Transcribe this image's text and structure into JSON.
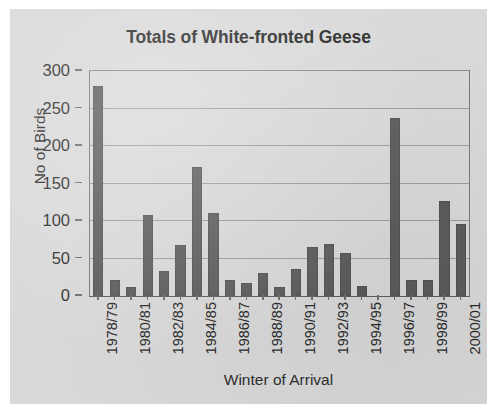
{
  "chart_data": {
    "type": "bar",
    "title": "Totals of White-fronted Geese",
    "xlabel": "Winter of Arrival",
    "ylabel": "No of Birds",
    "ylim": [
      0,
      300
    ],
    "yticks": [
      0,
      50,
      100,
      150,
      200,
      250,
      300
    ],
    "ytick_labels": [
      "0",
      "50",
      "100",
      "150",
      "200",
      "250",
      "300"
    ],
    "grid": "horizontal",
    "legend": "none",
    "bar_color": "#5c5c5c",
    "plot_background": "#d9d9d9",
    "categories": [
      "1978/79",
      "1979/80",
      "1980/81",
      "1981/82",
      "1982/83",
      "1983/84",
      "1984/85",
      "1985/86",
      "1986/87",
      "1987/88",
      "1988/89",
      "1989/90",
      "1990/91",
      "1991/92",
      "1992/93",
      "1993/94",
      "1994/95",
      "1995/96",
      "1996/97",
      "1997/98",
      "1998/99",
      "1999/00",
      "2000/01"
    ],
    "tick_labels_shown": [
      "1978/79",
      "",
      "1980/81",
      "",
      "1982/83",
      "",
      "1984/85",
      "",
      "1986/87",
      "",
      "1988/89",
      "",
      "1990/91",
      "",
      "1992/93",
      "",
      "1994/95",
      "",
      "1996/97",
      "",
      "1998/99",
      "",
      "2000/01"
    ],
    "values": [
      280,
      22,
      12,
      108,
      33,
      68,
      172,
      111,
      21,
      17,
      31,
      12,
      36,
      65,
      70,
      57,
      13,
      0,
      238,
      22,
      22,
      127,
      96
    ],
    "series": [
      {
        "name": "No of Birds",
        "values": [
          280,
          22,
          12,
          108,
          33,
          68,
          172,
          111,
          21,
          17,
          31,
          12,
          36,
          65,
          70,
          57,
          13,
          0,
          238,
          22,
          22,
          127,
          96
        ]
      }
    ]
  }
}
